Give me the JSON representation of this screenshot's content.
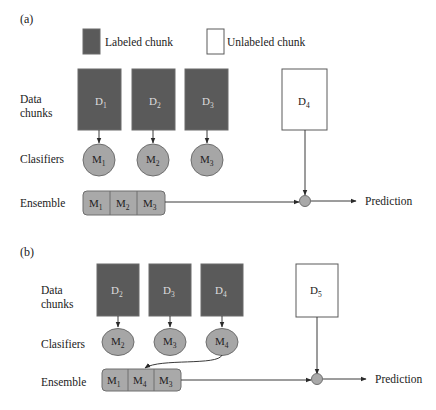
{
  "legend": {
    "labeled": "Labeled chunk",
    "unlabeled": "Unlabeled chunk"
  },
  "colors": {
    "labeled_chunk": "#5a5a5a",
    "unlabeled_chunk": "#ffffff",
    "classifier": "#a6a6a6"
  },
  "panels": [
    {
      "id": "(a)",
      "row_labels": {
        "data_line1": "Data",
        "data_line2": "chunks",
        "classifiers": "Clasifiers",
        "ensemble": "Ensemble"
      },
      "labeled_chunks": [
        {
          "base": "D",
          "sub": "1"
        },
        {
          "base": "D",
          "sub": "2"
        },
        {
          "base": "D",
          "sub": "3"
        }
      ],
      "unlabeled_chunk": {
        "base": "D",
        "sub": "4"
      },
      "classifiers": [
        {
          "base": "M",
          "sub": "1"
        },
        {
          "base": "M",
          "sub": "2"
        },
        {
          "base": "M",
          "sub": "3"
        }
      ],
      "ensemble": [
        {
          "base": "M",
          "sub": "1"
        },
        {
          "base": "M",
          "sub": "2"
        },
        {
          "base": "M",
          "sub": "3"
        }
      ],
      "output": "Prediction"
    },
    {
      "id": "(b)",
      "row_labels": {
        "data_line1": "Data",
        "data_line2": "chunks",
        "classifiers": "Clasifiers",
        "ensemble": "Ensemble"
      },
      "labeled_chunks": [
        {
          "base": "D",
          "sub": "2"
        },
        {
          "base": "D",
          "sub": "3"
        },
        {
          "base": "D",
          "sub": "4"
        }
      ],
      "unlabeled_chunk": {
        "base": "D",
        "sub": "5"
      },
      "classifiers": [
        {
          "base": "M",
          "sub": "2"
        },
        {
          "base": "M",
          "sub": "3"
        },
        {
          "base": "M",
          "sub": "4"
        }
      ],
      "ensemble": [
        {
          "base": "M",
          "sub": "1"
        },
        {
          "base": "M",
          "sub": "4"
        },
        {
          "base": "M",
          "sub": "3"
        }
      ],
      "output": "Prediction"
    }
  ]
}
